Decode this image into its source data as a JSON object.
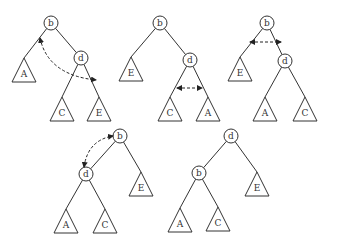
{
  "diagram": {
    "title": "",
    "colors": {
      "stroke": "#333333",
      "background": "#ffffff"
    },
    "trees": [
      {
        "id": "tree1",
        "nodes": [
          {
            "label": "b",
            "x": 51,
            "y": 23
          },
          {
            "label": "d",
            "x": 81,
            "y": 58
          }
        ],
        "subtrees": [
          {
            "label": "A",
            "x": 24,
            "y": 58
          },
          {
            "label": "C",
            "x": 62,
            "y": 97
          },
          {
            "label": "E",
            "x": 99,
            "y": 97
          }
        ],
        "edges": [
          [
            51,
            23,
            24,
            58
          ],
          [
            51,
            23,
            81,
            58
          ],
          [
            81,
            58,
            62,
            97
          ],
          [
            81,
            58,
            99,
            97
          ]
        ],
        "swap_arrow": {
          "d": "M 40 38 Q 48 75 96 80",
          "type": "curved-double"
        }
      },
      {
        "id": "tree2",
        "nodes": [
          {
            "label": "b",
            "x": 160,
            "y": 23
          },
          {
            "label": "d",
            "x": 190,
            "y": 60
          }
        ],
        "subtrees": [
          {
            "label": "E",
            "x": 131,
            "y": 57
          },
          {
            "label": "C",
            "x": 170,
            "y": 97
          },
          {
            "label": "A",
            "x": 208,
            "y": 97
          }
        ],
        "edges": [
          [
            160,
            23,
            131,
            57
          ],
          [
            160,
            23,
            190,
            60
          ],
          [
            190,
            60,
            170,
            97
          ],
          [
            190,
            60,
            208,
            97
          ]
        ],
        "swap_arrow": {
          "d": "M 177 88 L 202 88",
          "type": "straight-double"
        }
      },
      {
        "id": "tree3",
        "nodes": [
          {
            "label": "b",
            "x": 267,
            "y": 23
          },
          {
            "label": "d",
            "x": 285,
            "y": 61
          }
        ],
        "subtrees": [
          {
            "label": "E",
            "x": 240,
            "y": 57
          },
          {
            "label": "A",
            "x": 265,
            "y": 97
          },
          {
            "label": "C",
            "x": 305,
            "y": 97
          }
        ],
        "edges": [
          [
            267,
            23,
            240,
            57
          ],
          [
            267,
            23,
            285,
            61
          ],
          [
            285,
            61,
            265,
            97
          ],
          [
            285,
            61,
            305,
            97
          ]
        ],
        "swap_arrow": {
          "d": "M 250 42 L 281 42",
          "type": "straight-double"
        }
      },
      {
        "id": "tree4",
        "nodes": [
          {
            "label": "b",
            "x": 120,
            "y": 136
          },
          {
            "label": "d",
            "x": 86,
            "y": 174
          }
        ],
        "subtrees": [
          {
            "label": "E",
            "x": 141,
            "y": 172
          },
          {
            "label": "A",
            "x": 66,
            "y": 209
          },
          {
            "label": "C",
            "x": 105,
            "y": 209
          }
        ],
        "edges": [
          [
            120,
            136,
            86,
            174
          ],
          [
            120,
            136,
            141,
            172
          ],
          [
            86,
            174,
            66,
            209
          ],
          [
            86,
            174,
            105,
            209
          ]
        ],
        "swap_arrow": {
          "d": "M 84 167 Q 88 140 113 136",
          "type": "curved-double"
        }
      },
      {
        "id": "tree5",
        "nodes": [
          {
            "label": "d",
            "x": 231,
            "y": 136
          },
          {
            "label": "b",
            "x": 199,
            "y": 173
          }
        ],
        "subtrees": [
          {
            "label": "E",
            "x": 257,
            "y": 172
          },
          {
            "label": "A",
            "x": 180,
            "y": 208
          },
          {
            "label": "C",
            "x": 218,
            "y": 207
          }
        ],
        "edges": [
          [
            231,
            136,
            199,
            173
          ],
          [
            231,
            136,
            257,
            172
          ],
          [
            199,
            173,
            180,
            208
          ],
          [
            199,
            173,
            218,
            207
          ]
        ],
        "swap_arrow": null
      }
    ]
  }
}
